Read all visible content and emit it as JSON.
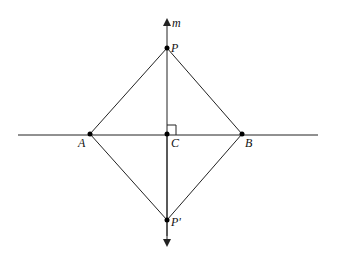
{
  "diagram": {
    "points": [
      {
        "id": "P",
        "label": "P"
      },
      {
        "id": "A",
        "label": "A"
      },
      {
        "id": "C",
        "label": "C"
      },
      {
        "id": "B",
        "label": "B"
      },
      {
        "id": "Pp",
        "label": "P'"
      }
    ],
    "line_label": "m",
    "segments": [
      "AP",
      "PB",
      "BP'",
      "P'A"
    ],
    "right_angle_at": "C"
  }
}
